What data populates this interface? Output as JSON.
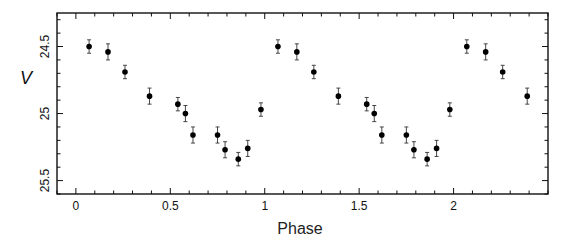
{
  "chart_data": {
    "type": "scatter",
    "title": "",
    "xlabel": "Phase",
    "ylabel": "V",
    "xlim": [
      -0.1,
      2.5
    ],
    "ylim": [
      24.25,
      25.6
    ],
    "y_inverted": true,
    "grid": false,
    "legend": null,
    "x_ticks": [
      0,
      0.5,
      1,
      1.5,
      2
    ],
    "x_tick_labels": [
      "0",
      "0.5",
      "1",
      "1.5",
      "2"
    ],
    "x_minor_step": 0.1,
    "y_ticks": [
      24.5,
      25,
      25.5
    ],
    "y_tick_labels": [
      "24.5",
      "25",
      "25.5"
    ],
    "y_minor_step": 0.1,
    "error_bar_default": 0.05,
    "series": [
      {
        "name": "V-band light curve",
        "marker": "filled-circle",
        "color": "#000000",
        "points": [
          {
            "phase": 0.07,
            "V": 24.5,
            "err": 0.05
          },
          {
            "phase": 0.17,
            "V": 24.54,
            "err": 0.06
          },
          {
            "phase": 0.26,
            "V": 24.69,
            "err": 0.05
          },
          {
            "phase": 0.39,
            "V": 24.87,
            "err": 0.06
          },
          {
            "phase": 0.54,
            "V": 24.93,
            "err": 0.05
          },
          {
            "phase": 0.58,
            "V": 25.0,
            "err": 0.06
          },
          {
            "phase": 0.62,
            "V": 25.16,
            "err": 0.06
          },
          {
            "phase": 0.75,
            "V": 25.16,
            "err": 0.06
          },
          {
            "phase": 0.79,
            "V": 25.27,
            "err": 0.06
          },
          {
            "phase": 0.86,
            "V": 25.34,
            "err": 0.05
          },
          {
            "phase": 0.91,
            "V": 25.26,
            "err": 0.06
          },
          {
            "phase": 0.98,
            "V": 24.97,
            "err": 0.05
          },
          {
            "phase": 1.07,
            "V": 24.5,
            "err": 0.05
          },
          {
            "phase": 1.17,
            "V": 24.54,
            "err": 0.06
          },
          {
            "phase": 1.26,
            "V": 24.69,
            "err": 0.05
          },
          {
            "phase": 1.39,
            "V": 24.87,
            "err": 0.06
          },
          {
            "phase": 1.54,
            "V": 24.93,
            "err": 0.05
          },
          {
            "phase": 1.58,
            "V": 25.0,
            "err": 0.06
          },
          {
            "phase": 1.62,
            "V": 25.16,
            "err": 0.06
          },
          {
            "phase": 1.75,
            "V": 25.16,
            "err": 0.06
          },
          {
            "phase": 1.79,
            "V": 25.27,
            "err": 0.06
          },
          {
            "phase": 1.86,
            "V": 25.34,
            "err": 0.05
          },
          {
            "phase": 1.91,
            "V": 25.26,
            "err": 0.06
          },
          {
            "phase": 1.98,
            "V": 24.97,
            "err": 0.05
          },
          {
            "phase": 2.07,
            "V": 24.5,
            "err": 0.05
          },
          {
            "phase": 2.17,
            "V": 24.54,
            "err": 0.06
          },
          {
            "phase": 2.26,
            "V": 24.69,
            "err": 0.05
          },
          {
            "phase": 2.39,
            "V": 24.87,
            "err": 0.06
          }
        ]
      }
    ]
  },
  "layout": {
    "plot_left": 57,
    "plot_right": 548,
    "plot_top": 13,
    "plot_bottom": 194
  }
}
